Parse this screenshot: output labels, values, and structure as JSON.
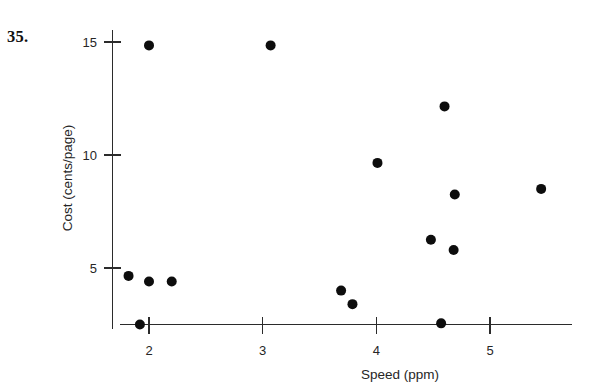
{
  "figure": {
    "problem_number": "35.",
    "background_color": "#ffffff",
    "ink_color": "#1a1a1a"
  },
  "chart_data": {
    "type": "scatter",
    "title": "",
    "xlabel": "Speed (ppm)",
    "ylabel": "Cost (cents/page)",
    "xlim": [
      1.6,
      5.75
    ],
    "ylim": [
      1.8,
      16.2
    ],
    "xticks": [
      2,
      3,
      4,
      5
    ],
    "xtick_labels": [
      "2",
      "3",
      "4",
      "5"
    ],
    "yticks": [
      5,
      10,
      15
    ],
    "ytick_labels": [
      "5",
      "10",
      "15"
    ],
    "grid": false,
    "legend": null,
    "marker": "filled-circle",
    "marker_color": "#0d0d0d",
    "marker_size": 5,
    "points": [
      {
        "x": 2.0,
        "y": 14.85
      },
      {
        "x": 3.07,
        "y": 14.85
      },
      {
        "x": 4.6,
        "y": 12.15
      },
      {
        "x": 4.01,
        "y": 9.65
      },
      {
        "x": 5.45,
        "y": 8.5
      },
      {
        "x": 4.69,
        "y": 8.25
      },
      {
        "x": 4.48,
        "y": 6.25
      },
      {
        "x": 4.68,
        "y": 5.8
      },
      {
        "x": 1.82,
        "y": 4.65
      },
      {
        "x": 2.0,
        "y": 4.4
      },
      {
        "x": 2.2,
        "y": 4.4
      },
      {
        "x": 3.69,
        "y": 4.0
      },
      {
        "x": 3.79,
        "y": 3.4
      },
      {
        "x": 1.92,
        "y": 2.5
      },
      {
        "x": 4.57,
        "y": 2.55
      }
    ],
    "x_values": [
      2.0,
      3.07,
      4.6,
      4.01,
      5.45,
      4.69,
      4.48,
      4.68,
      1.82,
      2.0,
      2.2,
      3.69,
      3.79,
      1.92,
      4.57
    ],
    "y_values": [
      14.85,
      14.85,
      12.15,
      9.65,
      8.5,
      8.25,
      6.25,
      5.8,
      4.65,
      4.4,
      4.4,
      4.0,
      3.4,
      2.5,
      2.55
    ]
  }
}
